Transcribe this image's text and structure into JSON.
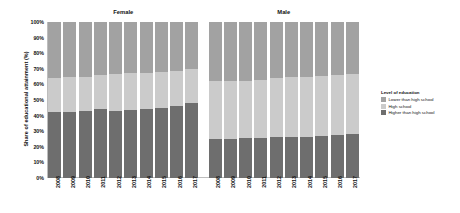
{
  "chart_data": {
    "type": "bar",
    "subtype": "stacked-100-percent",
    "title": "",
    "xlabel": "",
    "ylabel": "Share of educational attainment (%)",
    "ylim": [
      0,
      100
    ],
    "ytick_labels": [
      "100%",
      "90%",
      "80%",
      "70%",
      "60%",
      "50%",
      "40%",
      "30%",
      "20%",
      "10%",
      "0%"
    ],
    "ytick_values": [
      100,
      90,
      80,
      70,
      60,
      50,
      40,
      30,
      20,
      10,
      0
    ],
    "grid": false,
    "legend_position": "right",
    "legend_title": "Level of education",
    "series": [
      {
        "name": "Lower than high school",
        "color": "#a2a2a2",
        "values": [
          36.0,
          35.5,
          35.0,
          34.0,
          33.5,
          33.0,
          32.5,
          32.0,
          31.5,
          30.0,
          38.0,
          38.0,
          37.5,
          37.0,
          36.0,
          35.5,
          35.0,
          34.5,
          34.0,
          33.0
        ]
      },
      {
        "name": "High school",
        "color": "#cbcbcb",
        "values": [
          22.0,
          22.0,
          22.0,
          22.0,
          23.5,
          23.5,
          23.0,
          23.0,
          22.5,
          22.0,
          37.0,
          37.0,
          37.0,
          37.5,
          38.0,
          38.0,
          38.5,
          38.5,
          38.5,
          39.0
        ]
      },
      {
        "name": "Higher than high school",
        "color": "#6e6e6e",
        "values": [
          42.0,
          42.5,
          43.0,
          44.0,
          43.0,
          43.5,
          44.5,
          45.0,
          46.0,
          48.0,
          25.0,
          25.0,
          25.5,
          25.5,
          26.0,
          26.5,
          26.5,
          27.0,
          27.5,
          28.0
        ]
      }
    ],
    "groups": [
      {
        "label": "Female",
        "categories": [
          "2008",
          "2009",
          "2010",
          "2011",
          "2012",
          "2013",
          "2014",
          "2015",
          "2016",
          "2017"
        ]
      },
      {
        "label": "Male",
        "categories": [
          "2008",
          "2009",
          "2010",
          "2011",
          "2012",
          "2013",
          "2014",
          "2015",
          "2016",
          "2017"
        ]
      }
    ]
  },
  "legend": {
    "title": "Level of education",
    "items": [
      {
        "label": "Lower than high school",
        "color": "#a2a2a2"
      },
      {
        "label": "High school",
        "color": "#cbcbcb"
      },
      {
        "label": "Higher than high school",
        "color": "#6e6e6e"
      }
    ]
  },
  "axes": {
    "y_title": "Share of educational attainment (%)"
  }
}
